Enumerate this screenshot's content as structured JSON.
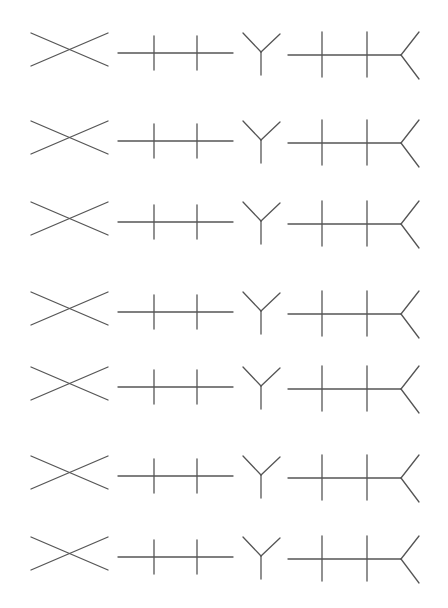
{
  "figure": {
    "width": 448,
    "height": 608,
    "background": "#ffffff",
    "stroke_color": "#555555",
    "stroke_width": 1.3,
    "rows": [
      {
        "index": 1,
        "center_y": 48
      },
      {
        "index": 2,
        "center_y": 136
      },
      {
        "index": 3,
        "center_y": 217
      },
      {
        "index": 4,
        "center_y": 307
      },
      {
        "index": 5,
        "center_y": 382
      },
      {
        "index": 6,
        "center_y": 471
      },
      {
        "index": 7,
        "center_y": 552
      }
    ],
    "shapes": [
      {
        "name": "x-cross",
        "label": "X"
      },
      {
        "name": "line-two-ticks",
        "label": "Line with two ticks"
      },
      {
        "name": "y-shape",
        "label": "Y"
      },
      {
        "name": "line-two-ticks-fork",
        "label": "Line with two ticks and fork"
      }
    ]
  }
}
